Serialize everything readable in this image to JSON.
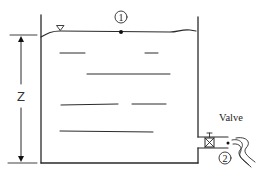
{
  "diagram": {
    "title": "",
    "labels": {
      "point1": "1",
      "point2": "2",
      "height": "Z",
      "valve": "Valve"
    },
    "symbols": {
      "free_surface_marker": "inverted-triangle",
      "valve_symbol": "gate-valve-box"
    },
    "colors": {
      "line": "#2a2a2a",
      "background": "#ffffff"
    }
  }
}
